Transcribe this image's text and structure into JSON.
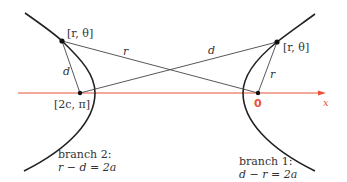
{
  "diagram": {
    "axis": {
      "label": "x",
      "color": "#e8533a"
    },
    "points": {
      "left_focus": {
        "label": "[2c, π]"
      },
      "origin": {
        "label": "0"
      },
      "left_point": {
        "label": "[r, θ]"
      },
      "right_point": {
        "label": "[r, θ]"
      }
    },
    "segments": {
      "left_r": "r",
      "left_d": "d",
      "right_d": "d",
      "right_r": "r"
    },
    "branches": [
      {
        "name": "branch 1:",
        "equation": "d − r = 2a"
      },
      {
        "name": "branch 2:",
        "equation": "r − d = 2a"
      }
    ],
    "colors": {
      "curve": "#222222",
      "line": "#444444",
      "axis": "#e8533a",
      "point": "#111111"
    }
  }
}
